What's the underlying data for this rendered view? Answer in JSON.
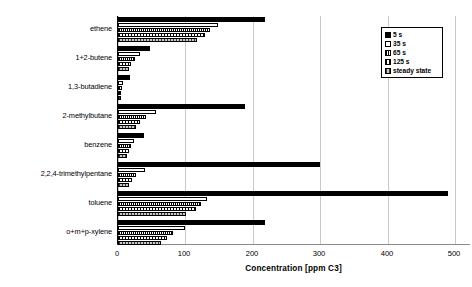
{
  "chart_data": {
    "type": "bar",
    "orientation": "horizontal",
    "title": "",
    "xlabel": "Concentration [ppm C3]",
    "ylabel": "",
    "xlim": [
      0,
      560
    ],
    "xticks": [
      0,
      100,
      200,
      300,
      400,
      500
    ],
    "xtick_labels": [
      "0",
      "100",
      "200",
      "300",
      "400",
      "500"
    ],
    "grid": "vertical",
    "legend_position": "top-right",
    "categories": [
      "ethene",
      "1+2-butene",
      "1,3-butadiene",
      "2-methylbutane",
      "benzene",
      "2,2,4-trimethylpentane",
      "toluene",
      "o+m+p-xylene"
    ],
    "series": [
      {
        "name": "5 s",
        "fill": "solid-black",
        "color": "#000000",
        "values": [
          218,
          48,
          18,
          188,
          39,
          300,
          489,
          218
        ]
      },
      {
        "name": "35 s",
        "fill": "white-outline",
        "color": "#ffffff",
        "values": [
          148,
          32,
          7,
          57,
          23,
          40,
          132,
          99
        ]
      },
      {
        "name": "65 s",
        "fill": "dense-vertical-hatch",
        "color": "#ffffff",
        "values": [
          137,
          25,
          6,
          42,
          20,
          27,
          123,
          82
        ]
      },
      {
        "name": "125 s",
        "fill": "medium-vertical-hatch",
        "color": "#ffffff",
        "values": [
          129,
          20,
          5,
          33,
          16,
          21,
          115,
          73
        ]
      },
      {
        "name": "steady state",
        "fill": "gray-hatch",
        "color": "#9a9a9a",
        "values": [
          117,
          16,
          4,
          27,
          13,
          17,
          101,
          64
        ]
      }
    ]
  },
  "legend": {
    "items": [
      {
        "label": "5 s"
      },
      {
        "label": "35 s"
      },
      {
        "label": "65 s"
      },
      {
        "label": "125 s"
      },
      {
        "label": "steady state"
      }
    ]
  }
}
